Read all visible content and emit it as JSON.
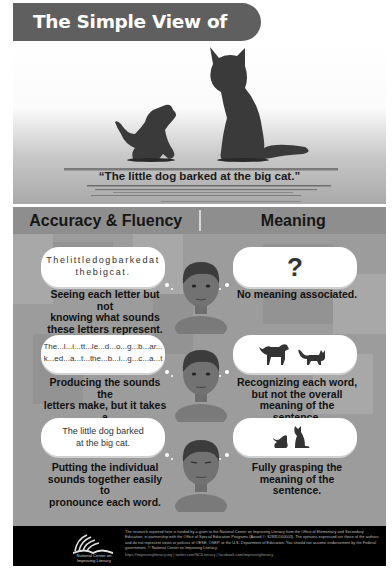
{
  "title": "The Simple View of Reading",
  "hero": {
    "sentence": "“The little dog barked at the big cat.”",
    "illustration": [
      "dog-silhouette-icon",
      "cat-silhouette-icon"
    ]
  },
  "columns": {
    "left_header": "Accuracy & Fluency",
    "right_header": "Meaning"
  },
  "rows": [
    {
      "left_bubble_lines": [
        "Thelittledogbarkedat",
        "thebigcat."
      ],
      "left_caption_lines": [
        "Seeing each letter but not",
        "knowing what sounds",
        "these letters represent."
      ],
      "right_bubble": "?",
      "right_caption_lines": [
        "No meaning associated."
      ]
    },
    {
      "left_bubble_lines": [
        "The...l...i...tt...le...d...o...g...b...ar...",
        "k...ed...a...t...the...b...i...g...c...a...t"
      ],
      "left_caption_lines": [
        "Producing the sounds the",
        "letters make, but it takes a",
        "lot of effort."
      ],
      "right_bubble_icons": [
        "dog-icon",
        "cat-icon"
      ],
      "right_caption_lines": [
        "Recognizing each word,",
        "but not the overall",
        "meaning of the sentence."
      ]
    },
    {
      "left_bubble_lines": [
        "The little dog barked",
        "at the big cat."
      ],
      "left_caption_lines": [
        "Putting the individual",
        "sounds together easily to",
        "pronounce each word."
      ],
      "right_bubble_icons": [
        "dog-barking-icon",
        "cat-sitting-icon"
      ],
      "right_caption_lines": [
        "Fully grasping the",
        "meaning of the sentence."
      ]
    }
  ],
  "footer": {
    "logo_text_lines": [
      "National Center on",
      "Improving Literacy"
    ],
    "disclaimer": "The research reported here is funded by a grant to the National Center on Improving Literacy from the Office of Elementary and Secondary Education, in partnership with the Office of Special Education Programs (Award #: S283D160003). The opinions expressed are those of the authors and do not represent views or policies of OESE, OSEP, or the U.S. Department of Education. You should not assume endorsement by the Federal government. © National Center on Improving Literacy.",
    "links": "https://improvingliteracy.org | twitter.com/NCILiteracy | facebook.com/improvingliteracy"
  },
  "colors": {
    "banner": "#5f5f5f",
    "header_bar": "#8e8e8e",
    "main_bg": "#9c9c9c",
    "footer_bg": "#000000",
    "silhouette": "#3a3a3a"
  }
}
